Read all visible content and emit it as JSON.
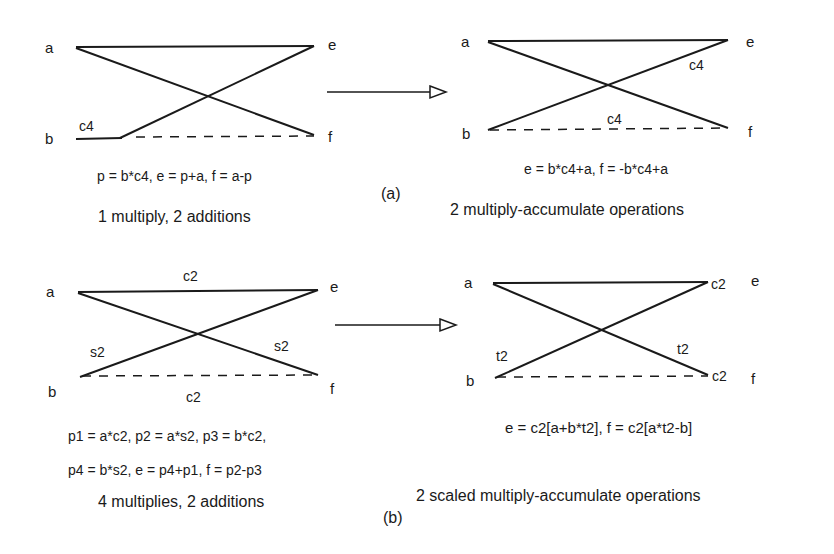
{
  "panel_a": {
    "tag": "(a)",
    "before": {
      "nodes": {
        "a": "a",
        "b": "b",
        "e": "e",
        "f": "f"
      },
      "coeff_b": "c4",
      "equation": "p = b*c4, e = p+a, f = a-p",
      "cost": "1 multiply, 2 additions"
    },
    "after": {
      "nodes": {
        "a": "a",
        "b": "b",
        "e": "e",
        "f": "f"
      },
      "coeff_upper": "c4",
      "coeff_lower": "c4",
      "equation": "e = b*c4+a, f = -b*c4+a",
      "cost": "2 multiply-accumulate operations"
    }
  },
  "panel_b": {
    "tag": "(b)",
    "before": {
      "nodes": {
        "a": "a",
        "b": "b",
        "e": "e",
        "f": "f"
      },
      "coeff_top": "c2",
      "coeff_left": "s2",
      "coeff_right": "s2",
      "coeff_bottom": "c2",
      "equation_line1": "p1 = a*c2, p2 = a*s2, p3 = b*c2,",
      "equation_line2": "p4  =  b*s2, e = p4+p1, f = p2-p3",
      "cost": "4 multiplies, 2 additions"
    },
    "after": {
      "nodes": {
        "a": "a",
        "b": "b",
        "e": "e",
        "f": "f"
      },
      "scale_e": "c2",
      "scale_f": "c2",
      "coeff_left": "t2",
      "coeff_right": "t2",
      "equation": "e =  c2[a+b*t2], f = c2[a*t2-b]",
      "cost": "2 scaled multiply-accumulate operations"
    }
  },
  "colors": {
    "ink": "#1a1a1a",
    "background": "#ffffff"
  }
}
